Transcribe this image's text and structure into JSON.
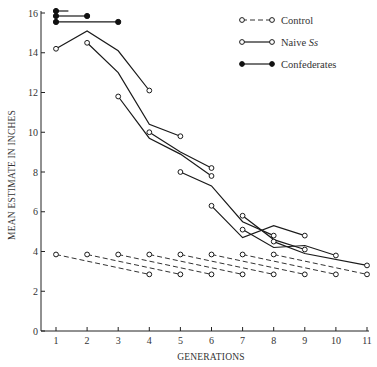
{
  "chart_data": {
    "type": "line",
    "title": "",
    "xlabel": "GENERATIONS",
    "ylabel": "MEAN ESTIMATE IN INCHES",
    "xlim": [
      1,
      11
    ],
    "ylim": [
      0,
      16
    ],
    "x_ticks": [
      1,
      2,
      3,
      4,
      5,
      6,
      7,
      8,
      9,
      10,
      11
    ],
    "y_ticks": [
      0,
      2,
      4,
      6,
      8,
      10,
      12,
      14,
      16
    ],
    "grid": false,
    "legend_position": "upper right",
    "legend": [
      {
        "label": "Control",
        "style": "dashed",
        "marker": "open-circle"
      },
      {
        "label": "Naive Ss",
        "style": "solid",
        "marker": "open-circle"
      },
      {
        "label": "Confederates",
        "style": "solid",
        "marker": "filled-circle"
      }
    ],
    "series": [
      {
        "name": "Confederates",
        "group": "Confederates",
        "points": [
          [
            1,
            16.1
          ],
          [
            1.4,
            16.1
          ]
        ]
      },
      {
        "name": "Confederates",
        "group": "Confederates",
        "points": [
          [
            1,
            15.85
          ],
          [
            2,
            15.85
          ]
        ]
      },
      {
        "name": "Confederates",
        "group": "Confederates",
        "points": [
          [
            1,
            15.55
          ],
          [
            3,
            15.55
          ]
        ]
      },
      {
        "name": "Naive Ss",
        "group": "Naive Ss",
        "points": [
          [
            1,
            14.2
          ],
          [
            2,
            15.1
          ],
          [
            3,
            14.1
          ],
          [
            4,
            12.1
          ]
        ]
      },
      {
        "name": "Naive Ss",
        "group": "Naive Ss",
        "points": [
          [
            2,
            14.5
          ],
          [
            3,
            13.0
          ],
          [
            4,
            10.4
          ],
          [
            5,
            9.8
          ]
        ]
      },
      {
        "name": "Naive Ss",
        "group": "Naive Ss",
        "points": [
          [
            3,
            11.8
          ],
          [
            4,
            9.7
          ],
          [
            5,
            8.9
          ],
          [
            6,
            7.8
          ]
        ]
      },
      {
        "name": "Naive Ss",
        "group": "Naive Ss",
        "points": [
          [
            4,
            10.0
          ],
          [
            5,
            9.0
          ],
          [
            6,
            8.2
          ]
        ]
      },
      {
        "name": "Naive Ss",
        "group": "Naive Ss",
        "points": [
          [
            5,
            8.0
          ],
          [
            6,
            7.3
          ],
          [
            7,
            5.5
          ],
          [
            8,
            4.8
          ]
        ]
      },
      {
        "name": "Naive Ss",
        "group": "Naive Ss",
        "points": [
          [
            6,
            6.3
          ],
          [
            7,
            4.7
          ],
          [
            8,
            5.3
          ],
          [
            9,
            4.8
          ]
        ]
      },
      {
        "name": "Naive Ss",
        "group": "Naive Ss",
        "points": [
          [
            7,
            5.8
          ],
          [
            8,
            4.6
          ],
          [
            9,
            4.1
          ]
        ]
      },
      {
        "name": "Naive Ss",
        "group": "Naive Ss",
        "points": [
          [
            7,
            5.1
          ],
          [
            8,
            4.2
          ],
          [
            9,
            4.3
          ],
          [
            10,
            3.8
          ]
        ]
      },
      {
        "name": "Naive Ss",
        "group": "Naive Ss",
        "points": [
          [
            8,
            4.5
          ],
          [
            9,
            3.9
          ],
          [
            11,
            3.3
          ]
        ]
      },
      {
        "name": "Control",
        "group": "Control",
        "points": [
          [
            1,
            3.85
          ],
          [
            4,
            2.85
          ]
        ]
      },
      {
        "name": "Control",
        "group": "Control",
        "points": [
          [
            2,
            3.85
          ],
          [
            5,
            2.85
          ]
        ]
      },
      {
        "name": "Control",
        "group": "Control",
        "points": [
          [
            3,
            3.85
          ],
          [
            6,
            2.85
          ]
        ]
      },
      {
        "name": "Control",
        "group": "Control",
        "points": [
          [
            4,
            3.85
          ],
          [
            7,
            2.85
          ]
        ]
      },
      {
        "name": "Control",
        "group": "Control",
        "points": [
          [
            5,
            3.85
          ],
          [
            8,
            2.85
          ]
        ]
      },
      {
        "name": "Control",
        "group": "Control",
        "points": [
          [
            6,
            3.85
          ],
          [
            9,
            2.85
          ]
        ]
      },
      {
        "name": "Control",
        "group": "Control",
        "points": [
          [
            7,
            3.85
          ],
          [
            10,
            2.85
          ]
        ]
      },
      {
        "name": "Control",
        "group": "Control",
        "points": [
          [
            8,
            3.85
          ],
          [
            11,
            2.85
          ]
        ]
      }
    ]
  }
}
